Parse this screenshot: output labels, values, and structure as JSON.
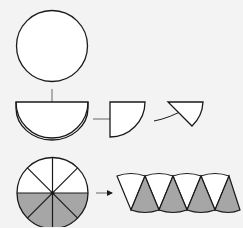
{
  "diagram": {
    "title": "",
    "colors": {
      "background": "#f3f3f3",
      "stroke": "#1a1a1a",
      "fill_light": "#ffffff",
      "fill_shaded": "#a6a6a6"
    },
    "steps": [
      {
        "id": "full-circle",
        "label": ""
      },
      {
        "id": "semicircle",
        "label": ""
      },
      {
        "id": "quarter-circle",
        "label": ""
      },
      {
        "id": "sector",
        "label": ""
      },
      {
        "id": "eighths-circle",
        "label": ""
      },
      {
        "id": "rearranged-sectors",
        "label": ""
      }
    ]
  }
}
